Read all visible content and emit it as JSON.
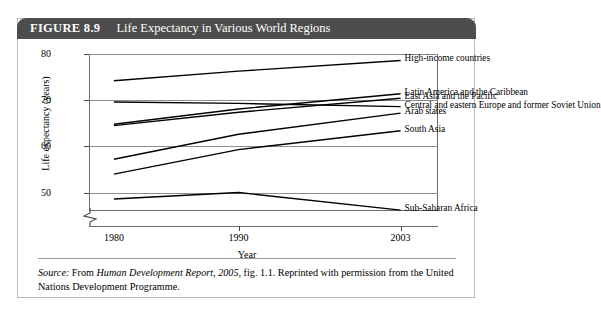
{
  "figure": {
    "number_label": "FIGURE 8.9",
    "title": "Life Expectancy in Various World Regions"
  },
  "source_note": {
    "lead": "Source:",
    "text_before": " From ",
    "italic_title": "Human Development Report, 2005",
    "text_after": ", fig. 1.1. Reprinted with permission from the United Nations Development Programme."
  },
  "chart_data": {
    "type": "line",
    "title": "Life Expectancy in Various World Regions",
    "xlabel": "Year",
    "ylabel": "Life expectancy (years)",
    "x": [
      1980,
      1990,
      2003
    ],
    "xtick_labels": [
      "1980",
      "1990",
      "2003"
    ],
    "ytick_labels": [
      "50",
      "60",
      "70",
      "80"
    ],
    "yticks": [
      50,
      60,
      70,
      80
    ],
    "ylim": [
      46,
      80
    ],
    "xlim": [
      1978,
      2006
    ],
    "grid": true,
    "axis_break": true,
    "legend_position": "inline-right",
    "series": [
      {
        "name": "High-income countries",
        "values": [
          74.2,
          76.3,
          78.6
        ]
      },
      {
        "name": "Latin America and the Caribbean",
        "values": [
          64.8,
          68.1,
          71.4
        ]
      },
      {
        "name": "East Asia and the Pacific",
        "values": [
          64.5,
          67.4,
          70.4
        ]
      },
      {
        "name": "Central and eastern Europe and former Soviet Union",
        "values": [
          69.6,
          69.3,
          68.6
        ]
      },
      {
        "name": "Arab states",
        "values": [
          57.2,
          62.6,
          67.2
        ]
      },
      {
        "name": "South Asia",
        "values": [
          54.0,
          59.3,
          63.4
        ]
      },
      {
        "name": "Sub-Saharan Africa",
        "values": [
          48.6,
          50.0,
          46.2
        ]
      }
    ]
  }
}
